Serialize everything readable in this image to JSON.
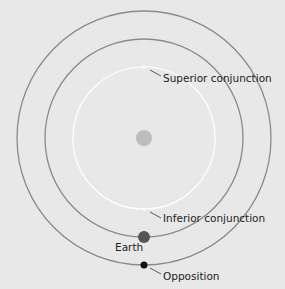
{
  "diagram": {
    "labels": {
      "superior": "Superior conjunction",
      "inferior": "Inferior conjunction",
      "earth": "Earth",
      "opposition": "Opposition"
    },
    "colors": {
      "background": "#e8e8e8",
      "outer_orbit": "#8a8a8a",
      "earth_orbit": "#8a8a8a",
      "inner_orbit": "#ffffff",
      "sun": "#bdbdbd",
      "earth": "#555555",
      "opposition_dot": "#111111"
    }
  }
}
